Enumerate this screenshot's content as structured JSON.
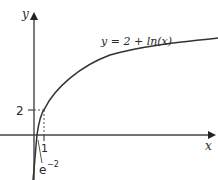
{
  "figure": {
    "type": "function-graph",
    "curve_label": "y = 2 + ln(x)",
    "axes": {
      "x_label": "x",
      "y_label": "y"
    },
    "annotations": {
      "y_tick": "2",
      "x_tick": "1",
      "x_intercept_base": "e",
      "x_intercept_exp": "−2"
    },
    "colors": {
      "curve": "#3a3a3a",
      "axis": "#3a3a3a",
      "guide": "#555555"
    }
  }
}
